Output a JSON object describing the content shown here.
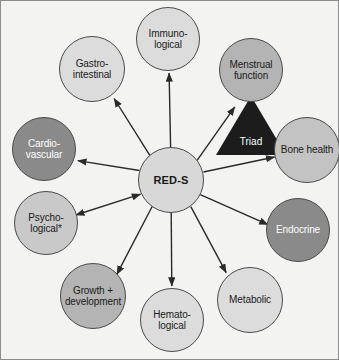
{
  "figure": {
    "background_color": "#f3f3f1",
    "border_color": "#8d8d8d"
  },
  "center": {
    "label": "RED-S",
    "fill": "#d8d8d8",
    "text_color": "#1a1a1a",
    "cx": 171,
    "cy": 180,
    "r": 33
  },
  "triad": {
    "label": "Triad",
    "fill": "#1c1c1c",
    "text_color": "#ffffff"
  },
  "nodes": [
    {
      "id": "immunological",
      "label": "Immuno-\nlogical",
      "fill": "#dcdcdc",
      "text_color": "#1a1a1a",
      "cx": 168,
      "cy": 39,
      "r": 32,
      "arrow": "single"
    },
    {
      "id": "menstrual-function",
      "label": "Menstrual\nfunction",
      "fill": "#b4b4b4",
      "text_color": "#1a1a1a",
      "cx": 251,
      "cy": 70,
      "r": 32,
      "arrow": "single"
    },
    {
      "id": "bone-health",
      "label": "Bone health",
      "fill": "#c3c3c3",
      "text_color": "#1a1a1a",
      "cx": 307,
      "cy": 150,
      "r": 33,
      "arrow": "single"
    },
    {
      "id": "endocrine",
      "label": "Endocrine",
      "fill": "#8a8a8a",
      "text_color": "#ffffff",
      "cx": 298,
      "cy": 230,
      "r": 32,
      "arrow": "single"
    },
    {
      "id": "metabolic",
      "label": "Metabolic",
      "fill": "#dcdcdc",
      "text_color": "#1a1a1a",
      "cx": 250,
      "cy": 300,
      "r": 33,
      "arrow": "single"
    },
    {
      "id": "hematological",
      "label": "Hemato-\nlogical",
      "fill": "#dcdcdc",
      "text_color": "#1a1a1a",
      "cx": 172,
      "cy": 320,
      "r": 32,
      "arrow": "single"
    },
    {
      "id": "growth-development",
      "label": "Growth +\ndevelopment",
      "fill": "#b4b4b4",
      "text_color": "#1a1a1a",
      "cx": 93,
      "cy": 296,
      "r": 33,
      "arrow": "single"
    },
    {
      "id": "psychological",
      "label": "Psycho-\nlogical*",
      "fill": "#c9c9c9",
      "text_color": "#1a1a1a",
      "cx": 46,
      "cy": 223,
      "r": 32,
      "arrow": "double"
    },
    {
      "id": "cardiovascular",
      "label": "Cardio-\nvascular",
      "fill": "#8a8a8a",
      "text_color": "#ffffff",
      "cx": 44,
      "cy": 149,
      "r": 32,
      "arrow": "single"
    },
    {
      "id": "gastrointestinal",
      "label": "Gastro-\nintestinal",
      "fill": "#dcdcdc",
      "text_color": "#1a1a1a",
      "cx": 92,
      "cy": 69,
      "r": 33,
      "arrow": "single"
    }
  ]
}
